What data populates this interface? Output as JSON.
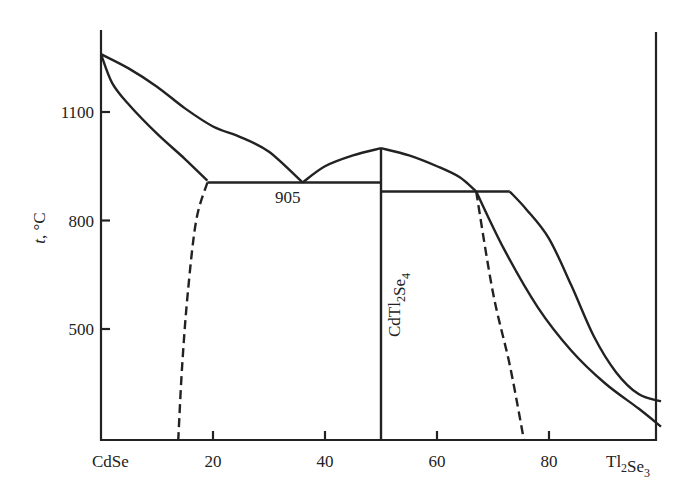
{
  "chart_data": {
    "type": "line",
    "title": "",
    "subtitle": "Phase diagram of the CdSe–Tl2Se3 system",
    "xlabel": "",
    "ylabel": "t, °C",
    "x_left_label": "CdSe",
    "x_right_label": "Tl2Se3",
    "x_ticks": [
      20,
      40,
      60,
      80
    ],
    "y_ticks": [
      500,
      800,
      1100
    ],
    "xlim": [
      0,
      100
    ],
    "ylim": [
      195,
      1330
    ],
    "grid": false,
    "legend": null,
    "annotations": [
      {
        "text": "905",
        "x": 36,
        "y": 905,
        "note": "eutectic temperature"
      },
      {
        "text": "CdTl2Se4",
        "x": 50,
        "y": 650,
        "note": "compound, vertical label"
      }
    ],
    "series": [
      {
        "name": "liquidus-left",
        "style": "solid",
        "points": [
          [
            0,
            1260
          ],
          [
            5,
            1220
          ],
          [
            10,
            1170
          ],
          [
            15,
            1110
          ],
          [
            20,
            1060
          ],
          [
            25,
            1030
          ],
          [
            30,
            990
          ],
          [
            36,
            905
          ]
        ]
      },
      {
        "name": "solidus-left",
        "style": "solid",
        "points": [
          [
            0,
            1260
          ],
          [
            2,
            1180
          ],
          [
            5,
            1120
          ],
          [
            10,
            1040
          ],
          [
            15,
            970
          ],
          [
            19,
            910
          ]
        ]
      },
      {
        "name": "eutectic-line-905",
        "style": "solid",
        "points": [
          [
            19,
            905
          ],
          [
            50,
            905
          ]
        ]
      },
      {
        "name": "liquidus-compound-left",
        "style": "solid",
        "points": [
          [
            36,
            905
          ],
          [
            40,
            950
          ],
          [
            45,
            980
          ],
          [
            50,
            1000
          ]
        ]
      },
      {
        "name": "compound-CdTl2Se4",
        "style": "solid",
        "points": [
          [
            50,
            1000
          ],
          [
            50,
            195
          ]
        ]
      },
      {
        "name": "liquidus-compound-right",
        "style": "solid",
        "points": [
          [
            50,
            1000
          ],
          [
            55,
            980
          ],
          [
            60,
            950
          ],
          [
            64,
            920
          ],
          [
            67,
            880
          ]
        ]
      },
      {
        "name": "peritectic-line",
        "style": "solid",
        "points": [
          [
            50,
            880
          ],
          [
            73,
            880
          ]
        ]
      },
      {
        "name": "liquidus-right",
        "style": "solid",
        "points": [
          [
            73,
            880
          ],
          [
            76,
            830
          ],
          [
            80,
            750
          ],
          [
            84,
            620
          ],
          [
            88,
            480
          ],
          [
            92,
            380
          ],
          [
            96,
            320
          ],
          [
            100,
            300
          ]
        ]
      },
      {
        "name": "solidus-right",
        "style": "solid",
        "points": [
          [
            67,
            880
          ],
          [
            72,
            720
          ],
          [
            78,
            560
          ],
          [
            84,
            440
          ],
          [
            90,
            350
          ],
          [
            96,
            280
          ],
          [
            100,
            230
          ]
        ]
      },
      {
        "name": "solubility-CdSe",
        "style": "dashed",
        "points": [
          [
            19,
            905
          ],
          [
            17,
            800
          ],
          [
            15.5,
            600
          ],
          [
            14.5,
            400
          ],
          [
            13.8,
            195
          ]
        ]
      },
      {
        "name": "solubility-Tl2Se3",
        "style": "dashed",
        "points": [
          [
            67,
            880
          ],
          [
            70,
            600
          ],
          [
            73,
            400
          ],
          [
            75.5,
            195
          ]
        ]
      }
    ]
  }
}
